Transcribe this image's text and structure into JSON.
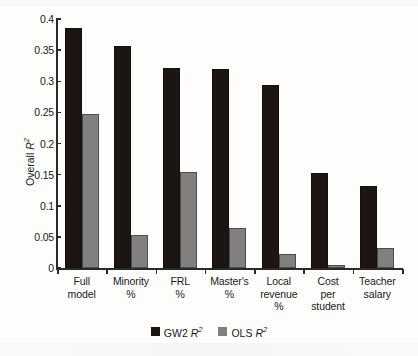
{
  "chart_data": {
    "type": "bar",
    "title": "",
    "xlabel": "",
    "ylabel": "Overall R2",
    "ylabel_parts": {
      "text": "Overall ",
      "symbol": "R",
      "exponent": "2"
    },
    "ylim": [
      0,
      0.4
    ],
    "ytick_labels": [
      "0.4",
      "0.35",
      "0.3",
      "0.25",
      "0.2",
      "0.15",
      "0.1",
      "0.05",
      "0"
    ],
    "ytick_values": [
      0.4,
      0.35,
      0.3,
      0.25,
      0.2,
      0.15,
      0.1,
      0.05,
      0
    ],
    "grid": false,
    "legend_position": "bottom-center",
    "categories": [
      "Full\nmodel",
      "Minority\n%",
      "FRL\n%",
      "Master's\n%",
      "Local\nrevenue\n%",
      "Cost\nper\nstudent",
      "Teacher\nsalary"
    ],
    "series": [
      {
        "name": "GW2 R2",
        "name_parts": {
          "text": "GW2 ",
          "symbol": "R",
          "exponent": "2"
        },
        "color": "#1c1512",
        "values": [
          0.386,
          0.357,
          0.321,
          0.319,
          0.294,
          0.152,
          0.131
        ]
      },
      {
        "name": "OLS R2",
        "name_parts": {
          "text": "OLS ",
          "symbol": "R",
          "exponent": "2"
        },
        "color": "#808080",
        "values": [
          0.247,
          0.053,
          0.155,
          0.065,
          0.023,
          0.005,
          0.032
        ]
      }
    ]
  }
}
